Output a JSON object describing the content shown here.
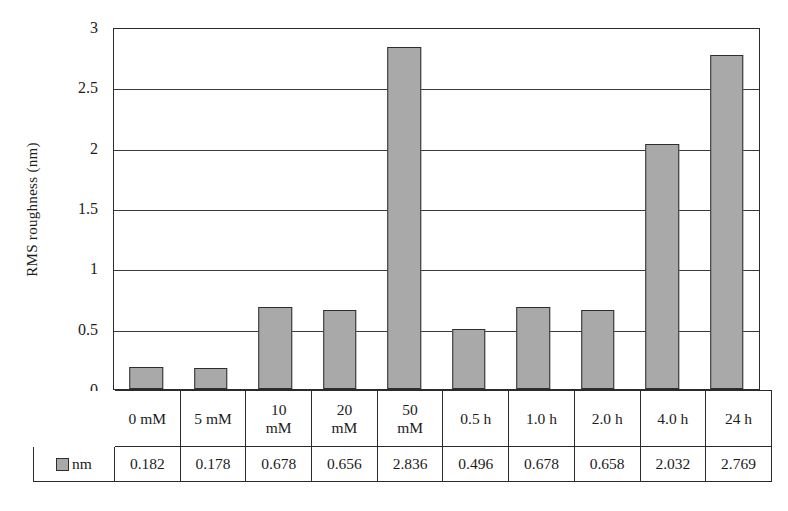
{
  "chart_data": {
    "type": "bar",
    "title": "",
    "xlabel": "",
    "ylabel": "RMS roughness (nm)",
    "ylim": [
      0,
      3
    ],
    "ytick_labels": [
      "3",
      "2.5",
      "2",
      "1.5",
      "1",
      "0.5",
      "0"
    ],
    "ytick_values": [
      3,
      2.5,
      2,
      1.5,
      1,
      0.5,
      0
    ],
    "grid": true,
    "legend_position": "table-row-header",
    "categories": [
      "0 mM",
      "5 mM",
      "10 mM",
      "20 mM",
      "50 mM",
      "0.5 h",
      "1.0 h",
      "2.0 h",
      "4.0 h",
      "24 h"
    ],
    "category_lines": [
      [
        "0 mM"
      ],
      [
        "5 mM"
      ],
      [
        "10",
        "mM"
      ],
      [
        "20",
        "mM"
      ],
      [
        "50",
        "mM"
      ],
      [
        "0.5 h"
      ],
      [
        "1.0 h"
      ],
      [
        "2.0 h"
      ],
      [
        "4.0 h"
      ],
      [
        "24 h"
      ]
    ],
    "series": [
      {
        "name": "nm",
        "values": [
          0.182,
          0.178,
          0.678,
          0.656,
          2.836,
          0.496,
          0.678,
          0.658,
          2.032,
          2.769
        ],
        "value_labels": [
          "0.182",
          "0.178",
          "0.678",
          "0.656",
          "2.836",
          "0.496",
          "0.678",
          "0.658",
          "2.032",
          "2.769"
        ],
        "color": "#a9a9a9",
        "border_color": "#2e2e2e"
      }
    ]
  },
  "axis": {
    "ylabel": "RMS roughness (nm)",
    "ticks": [
      {
        "label": "3",
        "value": 3
      },
      {
        "label": "2.5",
        "value": 2.5
      },
      {
        "label": "2",
        "value": 2
      },
      {
        "label": "1.5",
        "value": 1.5
      },
      {
        "label": "1",
        "value": 1
      },
      {
        "label": "0.5",
        "value": 0.5
      },
      {
        "label": "0",
        "value": 0
      }
    ]
  },
  "table": {
    "legend_label": "nm",
    "legend_swatch_color": "#a9a9a9",
    "categories": [
      {
        "lines": [
          "0 mM"
        ]
      },
      {
        "lines": [
          "5 mM"
        ]
      },
      {
        "lines": [
          "10",
          "mM"
        ]
      },
      {
        "lines": [
          "20",
          "mM"
        ]
      },
      {
        "lines": [
          "50",
          "mM"
        ]
      },
      {
        "lines": [
          "0.5 h"
        ]
      },
      {
        "lines": [
          "1.0 h"
        ]
      },
      {
        "lines": [
          "2.0 h"
        ]
      },
      {
        "lines": [
          "4.0 h"
        ]
      },
      {
        "lines": [
          "24 h"
        ]
      }
    ],
    "values": [
      "0.182",
      "0.178",
      "0.678",
      "0.656",
      "2.836",
      "0.496",
      "0.678",
      "0.658",
      "2.032",
      "2.769"
    ]
  },
  "style": {
    "bar_fill": "#a9a9a9",
    "bar_border": "#2e2e2e",
    "axis_color": "#2b2b2b",
    "grid_color": "#3a3a3a",
    "text_color": "#1c1c1c",
    "plot_background": "#ffffff"
  }
}
